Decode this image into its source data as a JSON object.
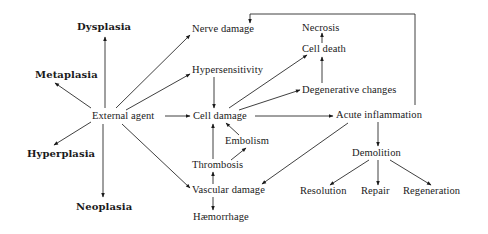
{
  "diagram": {
    "type": "flowchart",
    "nodes": {
      "dysplasia": "Dysplasia",
      "metaplasia": "Metaplasia",
      "external_agent": "External agent",
      "hyperplasia": "Hyperplasia",
      "neoplasia": "Neoplasia",
      "nerve_damage": "Nerve damage",
      "hypersensitivity": "Hypersensitivity",
      "cell_damage": "Cell damage",
      "embolism": "Embolism",
      "thrombosis": "Thrombosis",
      "vascular_damage": "Vascular damage",
      "haemorrhage": "Hæmorrhage",
      "necrosis": "Necrosis",
      "cell_death": "Cell death",
      "degenerative_changes": "Degenerative changes",
      "acute_inflammation": "Acute inflammation",
      "demolition": "Demolition",
      "resolution": "Resolution",
      "repair": "Repair",
      "regeneration": "Regeneration"
    },
    "edges": [
      {
        "from": "External agent",
        "to": "Dysplasia"
      },
      {
        "from": "External agent",
        "to": "Metaplasia"
      },
      {
        "from": "External agent",
        "to": "Hyperplasia"
      },
      {
        "from": "External agent",
        "to": "Neoplasia"
      },
      {
        "from": "External agent",
        "to": "Nerve damage"
      },
      {
        "from": "External agent",
        "to": "Hypersensitivity"
      },
      {
        "from": "External agent",
        "to": "Cell damage"
      },
      {
        "from": "External agent",
        "to": "Vascular damage"
      },
      {
        "from": "Hypersensitivity",
        "to": "Cell damage"
      },
      {
        "from": "Cell damage",
        "to": "Cell death"
      },
      {
        "from": "Cell damage",
        "to": "Degenerative changes"
      },
      {
        "from": "Cell damage",
        "to": "Acute inflammation"
      },
      {
        "from": "Degenerative changes",
        "to": "Cell death"
      },
      {
        "from": "Cell death",
        "to": "Necrosis"
      },
      {
        "from": "Embolism",
        "to": "Cell damage"
      },
      {
        "from": "Thrombosis",
        "to": "Embolism"
      },
      {
        "from": "Thrombosis",
        "to": "Cell damage"
      },
      {
        "from": "Vascular damage",
        "to": "Thrombosis"
      },
      {
        "from": "Vascular damage",
        "to": "Hæmorrhage"
      },
      {
        "from": "Acute inflammation",
        "to": "Vascular damage"
      },
      {
        "from": "Acute inflammation",
        "to": "Nerve damage"
      },
      {
        "from": "Acute inflammation",
        "to": "Demolition"
      },
      {
        "from": "Demolition",
        "to": "Resolution"
      },
      {
        "from": "Demolition",
        "to": "Repair"
      },
      {
        "from": "Demolition",
        "to": "Regeneration"
      }
    ]
  }
}
